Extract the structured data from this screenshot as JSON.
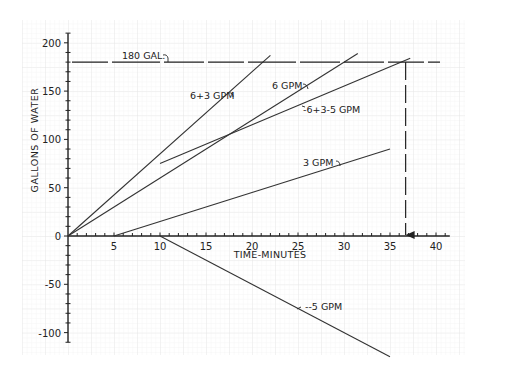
{
  "chart_data": {
    "type": "line",
    "title": "",
    "xlabel": "TIME-MINUTES",
    "ylabel": "GALLONS OF WATER",
    "xlim": [
      0,
      40
    ],
    "ylim": [
      -100,
      200
    ],
    "x_ticks": [
      5,
      10,
      15,
      20,
      25,
      30,
      35,
      40
    ],
    "y_ticks": [
      200,
      150,
      100,
      50,
      0,
      -50,
      -100
    ],
    "x_tick_labels": [
      "5",
      "10",
      "15",
      "20",
      "25",
      "30",
      "35",
      "40"
    ],
    "y_tick_labels": [
      "200",
      "150",
      "100",
      "50",
      "0",
      "-50",
      "-100"
    ],
    "zero_label": "0",
    "grid": true,
    "series": [
      {
        "name": "6+3 GPM",
        "label": "6+3 GPM",
        "points": [
          [
            0,
            0
          ],
          [
            22,
            187
          ]
        ]
      },
      {
        "name": "6 GPM",
        "label": "6 GPM",
        "points": [
          [
            0,
            0
          ],
          [
            31.5,
            189
          ]
        ]
      },
      {
        "name": "6+3-5 GPM",
        "label": "6+3-5 GPM",
        "points": [
          [
            10,
            75
          ],
          [
            37.2,
            184
          ]
        ]
      },
      {
        "name": "3 GPM",
        "label": "3 GPM",
        "points": [
          [
            5,
            0
          ],
          [
            35,
            90
          ]
        ]
      },
      {
        "name": "-5 GPM",
        "label": "-5 GPM",
        "points": [
          [
            10,
            0
          ],
          [
            35,
            -125
          ]
        ]
      }
    ],
    "annotations": [
      {
        "type": "hline-dashed",
        "y": 180,
        "label": "180 GAL."
      },
      {
        "type": "vline-dashed-arrow",
        "x": 36.7,
        "from_y": 180,
        "to_y": 0
      }
    ]
  }
}
